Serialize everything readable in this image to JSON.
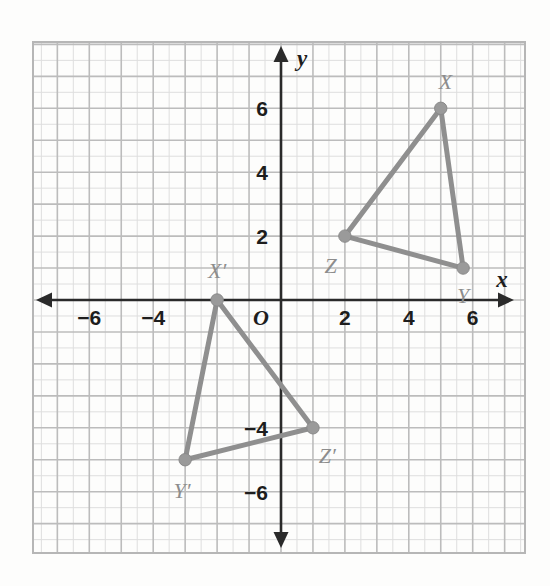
{
  "figure": {
    "axis_x_label": "x",
    "axis_y_label": "y",
    "origin_label": "O",
    "line_color": "#8f8f8f",
    "vertex_color": "#9a9a9a",
    "grid_minor_color": "#dedede",
    "grid_major_color": "#bcbcbc",
    "axis_color": "#2a2a2a",
    "label_color": "#8d8d8d"
  },
  "chart_data": {
    "type": "scatter",
    "xlabel": "x",
    "ylabel": "y",
    "xlim": [
      -7.75,
      7.625
    ],
    "ylim": [
      -8.0,
      8.0
    ],
    "grid": true,
    "legend": "none",
    "x_ticks": [
      -6,
      -4,
      2,
      4,
      6
    ],
    "x_tick_labels": [
      "−6",
      "−4",
      "2",
      "4",
      "6"
    ],
    "y_ticks": [
      6,
      4,
      2,
      -4,
      -6
    ],
    "y_tick_labels": [
      "6",
      "4",
      "2",
      "−4",
      "−6"
    ],
    "origin_label": "O",
    "grid_step": 1,
    "series": [
      {
        "name": "Triangle XYZ",
        "closed": true,
        "points": [
          {
            "label": "X",
            "x": 5,
            "y": 6,
            "label_dx": 0.15,
            "label_dy": 0.85
          },
          {
            "label": "Y",
            "x": 5.7,
            "y": 1,
            "label_dx": 0.0,
            "label_dy": -0.85
          },
          {
            "label": "Z",
            "x": 2,
            "y": 2,
            "label_dx": -0.45,
            "label_dy": -0.9
          }
        ]
      },
      {
        "name": "Triangle X'Y'Z'",
        "closed": true,
        "points": [
          {
            "label": "X′",
            "x": -2,
            "y": 0,
            "label_dx": 0.0,
            "label_dy": 0.95
          },
          {
            "label": "Y′",
            "x": -3,
            "y": -5,
            "label_dx": -0.1,
            "label_dy": -0.95
          },
          {
            "label": "Z′",
            "x": 1,
            "y": -4,
            "label_dx": 0.45,
            "label_dy": -0.85
          }
        ]
      }
    ]
  }
}
